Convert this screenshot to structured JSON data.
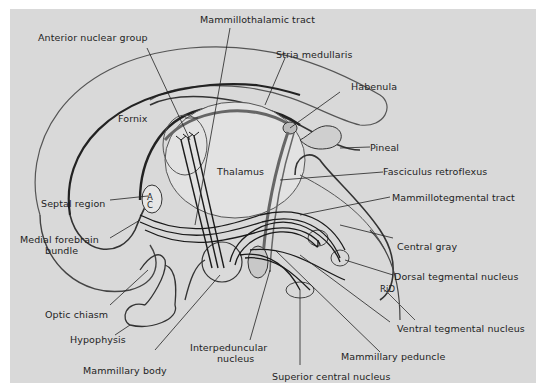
{
  "figure": {
    "type": "anatomical-diagram",
    "background_color": "#d9d9d9",
    "line_color": "#1e1e1e"
  },
  "labels": {
    "mammillothalamic_tract": "Mammillothalamic tract",
    "anterior_nuclear_group": "Anterior nuclear group",
    "stria_medullaris": "Stria medullaris",
    "habenula": "Habenula",
    "fornix": "Fornix",
    "pineal": "Pineal",
    "thalamus": "Thalamus",
    "fasciculus_retroflexus": "Fasciculus retroflexus",
    "mammillotegmental_tract": "Mammillotegmental tract",
    "septal_region": "Septal region",
    "ac": "A C",
    "medial_forebrain_bundle_1": "Medial forebrain",
    "medial_forebrain_bundle_2": "bundle",
    "central_gray": "Central gray",
    "dorsal_tegmental_nucleus": "Dorsal tegmental nucleus",
    "rid": "RiD",
    "optic_chiasm": "Optic chiasm",
    "hypophysis": "Hypophysis",
    "ventral_tegmental_nucleus": "Ventral tegmental nucleus",
    "interpeduncular_nucleus_1": "Interpeduncular",
    "interpeduncular_nucleus_2": "nucleus",
    "mammillary_peduncle": "Mammillary peduncle",
    "mammillary_body": "Mammillary body",
    "superior_central_nucleus": "Superior central nucleus"
  }
}
